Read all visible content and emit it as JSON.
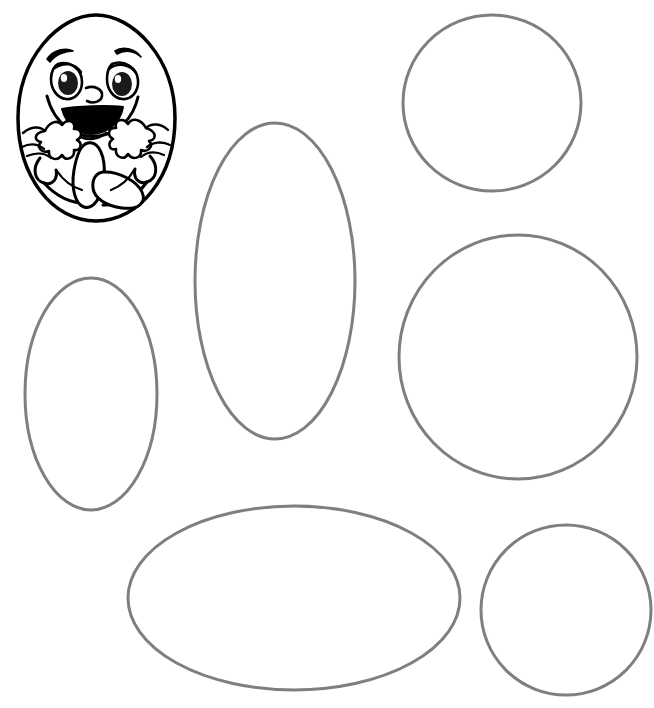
{
  "page": {
    "width": 654,
    "height": 708,
    "background_color": "#ffffff",
    "watermark": "g.com"
  },
  "colors": {
    "outline_gray": "#7f7f7f",
    "outline_black": "#000000",
    "fill_white": "#ffffff",
    "pupil_black": "#1a1a1a"
  },
  "character": {
    "name": "cartoon-egg-character",
    "label": "Smiling cartoon egg with arms and legs",
    "stroke_color": "#000000",
    "stroke_width": 3,
    "bounds": {
      "x": 18,
      "y": 14,
      "width": 157,
      "height": 208
    },
    "features": [
      "egg-body",
      "left-eyebrow",
      "right-eyebrow",
      "left-eye",
      "right-eye",
      "nose",
      "smiling-mouth",
      "left-arm-hand",
      "right-arm-hand",
      "left-leg-foot",
      "right-leg-foot"
    ]
  },
  "shapes": [
    {
      "id": "shape-circle-top-right",
      "name": "circle-top-right",
      "type": "circle",
      "cx": 492,
      "cy": 103,
      "rx": 89,
      "ry": 88,
      "rotation": 0,
      "stroke": "#7f7f7f",
      "stroke_width": 3
    },
    {
      "id": "shape-ellipse-tall-center",
      "name": "ellipse-tall-center",
      "type": "ellipse",
      "cx": 275,
      "cy": 281,
      "rx": 80,
      "ry": 158,
      "rotation": 0,
      "stroke": "#7f7f7f",
      "stroke_width": 3
    },
    {
      "id": "shape-ellipse-tall-left",
      "name": "ellipse-tall-left",
      "type": "ellipse",
      "cx": 91,
      "cy": 394,
      "rx": 66,
      "ry": 116,
      "rotation": 0,
      "stroke": "#7f7f7f",
      "stroke_width": 3
    },
    {
      "id": "shape-circle-middle-right",
      "name": "circle-middle-right",
      "type": "circle",
      "cx": 518,
      "cy": 357,
      "rx": 119,
      "ry": 122,
      "rotation": 0,
      "stroke": "#7f7f7f",
      "stroke_width": 3
    },
    {
      "id": "shape-ellipse-wide-bottom",
      "name": "ellipse-wide-bottom",
      "type": "ellipse",
      "cx": 294,
      "cy": 598,
      "rx": 166,
      "ry": 92,
      "rotation": 0,
      "stroke": "#7f7f7f",
      "stroke_width": 3
    },
    {
      "id": "shape-circle-bottom-right",
      "name": "circle-bottom-right",
      "type": "circle",
      "cx": 566,
      "cy": 610,
      "rx": 85,
      "ry": 85,
      "rotation": 0,
      "stroke": "#7f7f7f",
      "stroke_width": 3
    }
  ]
}
